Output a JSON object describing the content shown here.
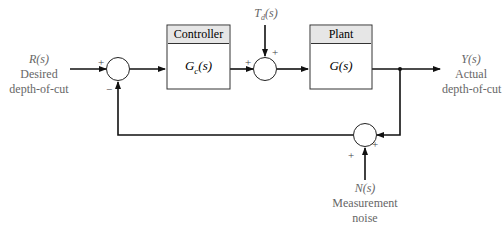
{
  "diagram": {
    "type": "feedback-control-block-diagram",
    "input": {
      "symbol": "R(s)",
      "line1": "Desired",
      "line2": "depth-of-cut"
    },
    "output": {
      "symbol": "Y(s)",
      "line1": "Actual",
      "line2": "depth-of-cut"
    },
    "disturbance": {
      "symbol": "T_d(s)",
      "main": "T",
      "sub": "d",
      "tail": "(s)"
    },
    "noise": {
      "symbol": "N(s)",
      "line1": "Measurement",
      "line2": "noise"
    },
    "blocks": [
      {
        "id": "controller",
        "title": "Controller",
        "tf": "G_c(s)",
        "tf_main": "G",
        "tf_sub": "c",
        "tf_tail": "(s)"
      },
      {
        "id": "plant",
        "title": "Plant",
        "tf": "G(s)"
      }
    ],
    "summing_junctions": [
      {
        "id": "error",
        "signs": {
          "left": "+",
          "bottom": "−"
        }
      },
      {
        "id": "disturbance",
        "signs": {
          "left": "+",
          "top": "+"
        }
      },
      {
        "id": "noise",
        "signs": {
          "right": "+",
          "bottom": "+"
        }
      }
    ]
  }
}
